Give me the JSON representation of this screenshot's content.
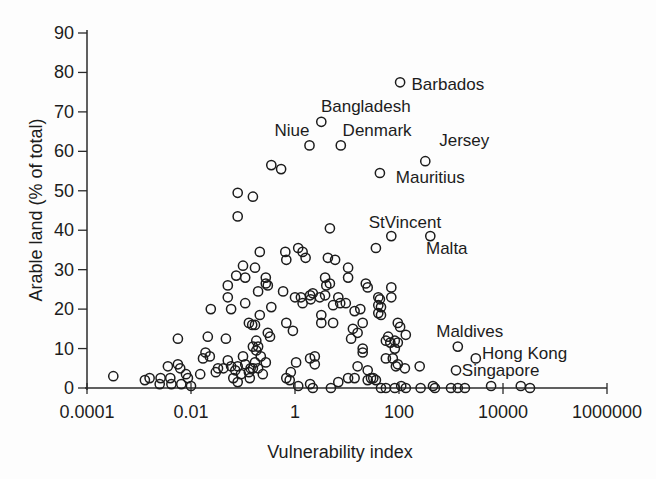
{
  "chart_data": {
    "type": "scatter",
    "title": "",
    "xlabel": "Vulnerability index",
    "ylabel": "Arable land (% of total)",
    "x_scale": "log",
    "xlim": [
      0.0001,
      1000000
    ],
    "ylim": [
      0,
      90
    ],
    "grid": "off",
    "legend": "none",
    "marker": {
      "shape": "open-circle",
      "color": "#1c1c1c",
      "fill": "none"
    },
    "x_ticks": {
      "values": [
        0.0001,
        0.01,
        1,
        100,
        10000,
        1000000
      ],
      "labels": [
        "0.0001",
        "0.01",
        "1",
        "100",
        "10000",
        "1000000"
      ]
    },
    "y_ticks": [
      0,
      10,
      20,
      30,
      40,
      50,
      60,
      70,
      80,
      90
    ],
    "annotations": [
      {
        "text": "Barbados",
        "x": 870,
        "y": 77
      },
      {
        "text": "Bangladesh",
        "x": 23,
        "y": 71.5
      },
      {
        "text": "Niue",
        "x": 0.87,
        "y": 65.5
      },
      {
        "text": "Denmark",
        "x": 38,
        "y": 65.5
      },
      {
        "text": "Jersey",
        "x": 1800,
        "y": 63
      },
      {
        "text": "Mauritius",
        "x": 400,
        "y": 53.5
      },
      {
        "text": "StVincent",
        "x": 130,
        "y": 42
      },
      {
        "text": "Malta",
        "x": 830,
        "y": 35.5
      },
      {
        "text": "Maldives",
        "x": 2300,
        "y": 14.5
      },
      {
        "text": "Hong Kong",
        "x": 26000,
        "y": 9
      },
      {
        "text": "Singapore",
        "x": 9000,
        "y": 4.5
      }
    ],
    "labeled_points": [
      {
        "name": "Barbados",
        "x": 105,
        "y": 77.5
      },
      {
        "name": "Bangladesh",
        "x": 3.2,
        "y": 67.5
      },
      {
        "name": "Niue",
        "x": 1.9,
        "y": 61.5
      },
      {
        "name": "Denmark",
        "x": 7.6,
        "y": 61.5
      },
      {
        "name": "Jersey",
        "x": 320,
        "y": 57.5
      },
      {
        "name": "Mauritius",
        "x": 43,
        "y": 54.5
      },
      {
        "name": "StVincent",
        "x": 71,
        "y": 38.5
      },
      {
        "name": "Malta",
        "x": 400,
        "y": 38.5
      },
      {
        "name": "Maldives",
        "x": 1350,
        "y": 10.5
      },
      {
        "name": "Hong Kong",
        "x": 3000,
        "y": 7.5
      },
      {
        "name": "Singapore",
        "x": 1250,
        "y": 4.5
      }
    ],
    "points": [
      [
        0.00032,
        3
      ],
      [
        0.0013,
        2
      ],
      [
        0.0016,
        2.5
      ],
      [
        0.0025,
        1
      ],
      [
        0.0026,
        2.5
      ],
      [
        0.0036,
        5.5
      ],
      [
        0.004,
        2.5
      ],
      [
        0.0042,
        1
      ],
      [
        0.0056,
        12.5
      ],
      [
        0.0056,
        6
      ],
      [
        0.0062,
        5
      ],
      [
        0.0065,
        1
      ],
      [
        0.008,
        3.5
      ],
      [
        0.0087,
        2.5
      ],
      [
        0.01,
        0.5
      ],
      [
        0.015,
        3.5
      ],
      [
        0.017,
        7.5
      ],
      [
        0.019,
        9
      ],
      [
        0.021,
        13
      ],
      [
        0.023,
        8
      ],
      [
        0.024,
        20
      ],
      [
        0.03,
        4
      ],
      [
        0.033,
        5
      ],
      [
        0.042,
        5
      ],
      [
        0.047,
        12.5
      ],
      [
        0.051,
        7
      ],
      [
        0.059,
        5.5
      ],
      [
        0.059,
        20
      ],
      [
        0.065,
        2.5
      ],
      [
        0.071,
        4.5
      ],
      [
        0.079,
        5.5
      ],
      [
        0.079,
        1.5
      ],
      [
        0.091,
        3.5
      ],
      [
        0.11,
        21.5
      ],
      [
        0.13,
        4
      ],
      [
        0.13,
        16.5
      ],
      [
        0.135,
        2.5
      ],
      [
        0.14,
        5
      ],
      [
        0.15,
        16
      ],
      [
        0.155,
        10.5
      ],
      [
        0.17,
        6.5
      ],
      [
        0.051,
        26
      ],
      [
        0.051,
        23
      ],
      [
        0.074,
        28.5
      ],
      [
        0.079,
        49.5
      ],
      [
        0.079,
        43.5
      ],
      [
        0.1,
        31
      ],
      [
        0.11,
        28
      ],
      [
        0.155,
        48.5
      ],
      [
        0.17,
        30.5
      ],
      [
        0.195,
        24.5
      ],
      [
        0.21,
        34.5
      ],
      [
        0.275,
        28
      ],
      [
        0.275,
        26.5
      ],
      [
        0.3,
        26
      ],
      [
        0.35,
        56.5
      ],
      [
        0.54,
        55.5
      ],
      [
        0.59,
        24.5
      ],
      [
        0.65,
        34.5
      ],
      [
        0.68,
        32.5
      ],
      [
        1.0,
        23
      ],
      [
        1.15,
        35.5
      ],
      [
        1.3,
        23
      ],
      [
        1.4,
        34.5
      ],
      [
        1.6,
        33
      ],
      [
        1.95,
        23.5
      ],
      [
        2.2,
        24
      ],
      [
        3.8,
        28
      ],
      [
        4.0,
        26
      ],
      [
        4.7,
        26.5
      ],
      [
        4.3,
        33
      ],
      [
        5.9,
        32.5
      ],
      [
        10.5,
        30.5
      ],
      [
        10.5,
        28
      ],
      [
        6.8,
        23
      ],
      [
        4.7,
        40.5
      ],
      [
        36,
        35.5
      ],
      [
        23,
        26.5
      ],
      [
        25,
        25.5
      ],
      [
        71,
        25.5
      ],
      [
        71,
        23
      ],
      [
        40,
        23
      ],
      [
        43,
        22.5
      ],
      [
        1.4,
        21.5
      ],
      [
        2.0,
        22.5
      ],
      [
        3.0,
        23
      ],
      [
        3.8,
        23.5
      ],
      [
        5.4,
        21
      ],
      [
        7.4,
        21.5
      ],
      [
        9.5,
        21.5
      ],
      [
        14,
        19.5
      ],
      [
        18,
        20
      ],
      [
        45,
        20.5
      ],
      [
        40,
        21
      ],
      [
        45,
        18.5
      ],
      [
        40,
        19
      ],
      [
        0.35,
        20.5
      ],
      [
        0.21,
        18.5
      ],
      [
        0.17,
        16
      ],
      [
        0.68,
        16.5
      ],
      [
        0.91,
        14.5
      ],
      [
        3.2,
        18.5
      ],
      [
        3.2,
        16.5
      ],
      [
        5.4,
        16.5
      ],
      [
        13,
        15
      ],
      [
        16,
        14
      ],
      [
        20,
        16.5
      ],
      [
        12,
        12.5
      ],
      [
        0.3,
        14
      ],
      [
        0.33,
        13
      ],
      [
        0.18,
        12
      ],
      [
        0.195,
        10.5
      ],
      [
        0.18,
        9.5
      ],
      [
        0.22,
        8
      ],
      [
        0.1,
        8
      ],
      [
        0.11,
        6
      ],
      [
        0.155,
        5
      ],
      [
        0.195,
        5
      ],
      [
        0.24,
        3.5
      ],
      [
        0.275,
        6.5
      ],
      [
        0.83,
        4
      ],
      [
        1.05,
        6.5
      ],
      [
        1.95,
        7.5
      ],
      [
        2.4,
        8
      ],
      [
        2.4,
        6
      ],
      [
        0.68,
        2.5
      ],
      [
        0.79,
        2
      ],
      [
        20,
        10
      ],
      [
        20,
        9
      ],
      [
        16,
        5.5
      ],
      [
        25,
        4.5
      ],
      [
        29,
        2.5
      ],
      [
        36,
        2
      ],
      [
        56,
        12
      ],
      [
        68,
        11.5
      ],
      [
        83,
        10
      ],
      [
        56,
        7.5
      ],
      [
        76,
        7.5
      ],
      [
        87,
        5.5
      ],
      [
        95,
        16.5
      ],
      [
        105,
        15.5
      ],
      [
        135,
        13.5
      ],
      [
        62,
        13
      ],
      [
        83,
        12
      ],
      [
        95,
        11.5
      ],
      [
        95,
        6
      ],
      [
        130,
        5
      ],
      [
        250,
        5.5
      ],
      [
        10.5,
        2.5
      ],
      [
        14,
        2.5
      ],
      [
        25,
        2
      ],
      [
        32,
        2.5
      ],
      [
        1.15,
        0.5
      ],
      [
        1.95,
        1
      ],
      [
        2.2,
        0
      ],
      [
        4.9,
        0
      ],
      [
        6.8,
        1.5
      ],
      [
        45,
        0
      ],
      [
        56,
        0
      ],
      [
        83,
        0
      ],
      [
        110,
        0.5
      ],
      [
        135,
        0
      ],
      [
        260,
        0
      ],
      [
        450,
        0.5
      ],
      [
        490,
        0
      ],
      [
        1000,
        0
      ],
      [
        1350,
        0
      ],
      [
        1850,
        0
      ],
      [
        5900,
        0.5
      ],
      [
        22000,
        0.5
      ],
      [
        33000,
        0
      ],
      [
        105,
        77.5
      ],
      [
        3.2,
        67.5
      ],
      [
        1.9,
        61.5
      ],
      [
        7.6,
        61.5
      ],
      [
        320,
        57.5
      ],
      [
        43,
        54.5
      ],
      [
        71,
        38.5
      ],
      [
        400,
        38.5
      ],
      [
        1350,
        10.5
      ],
      [
        3000,
        7.5
      ],
      [
        1250,
        4.5
      ]
    ]
  }
}
